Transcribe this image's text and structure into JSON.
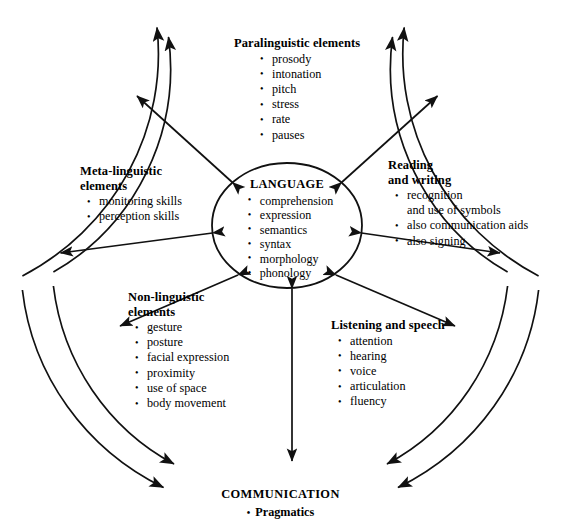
{
  "diagram": {
    "center": {
      "title": "LANGUAGE",
      "items": [
        "comprehension",
        "expression",
        "semantics",
        "syntax",
        "morphology",
        "phonology"
      ]
    },
    "blocks": [
      {
        "id": "paralinguistic",
        "title": "Paralinguistic elements",
        "items": [
          "prosody",
          "intonation",
          "pitch",
          "stress",
          "rate",
          "pauses"
        ]
      },
      {
        "id": "meta-linguistic",
        "title": "Meta-linguistic\nelements",
        "items": [
          "monitoring skills",
          "perception skills"
        ]
      },
      {
        "id": "reading-and-writing",
        "title": "Reading\nand writing",
        "items": [
          "recognition\nand use of symbols",
          "also communication aids",
          "also signing"
        ]
      },
      {
        "id": "non-linguistic",
        "title": "Non-linguistic\nelements",
        "items": [
          "gesture",
          "posture",
          "facial expression",
          "proximity",
          "use of space",
          "body movement"
        ]
      },
      {
        "id": "listening-and-speech",
        "title": "Listening and speech",
        "items": [
          "attention",
          "hearing",
          "voice",
          "articulation",
          "fluency"
        ]
      }
    ],
    "outer_label": {
      "title": "COMMUNICATION",
      "bullet": "Pragmatics",
      "bullet_glyph": "•"
    },
    "colors": {
      "stroke": "#111111",
      "background": "#ffffff",
      "text": "#000000"
    }
  }
}
